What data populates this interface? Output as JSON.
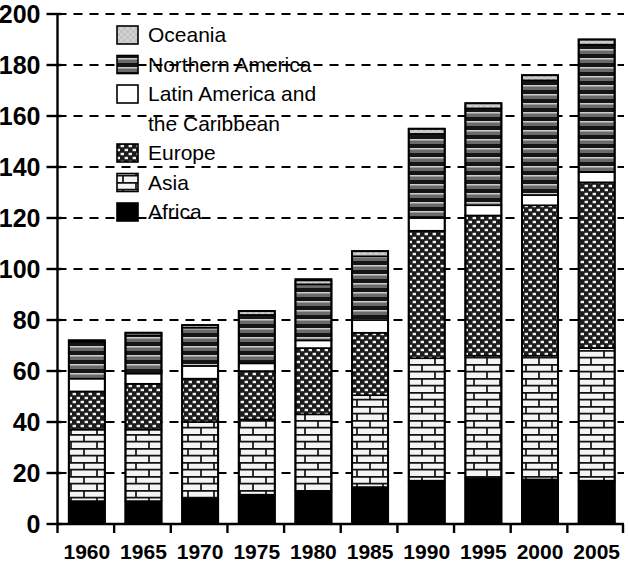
{
  "chart_data": {
    "type": "bar",
    "subtype": "stacked-bar",
    "title": "",
    "xlabel": "",
    "ylabel": "",
    "ylim": [
      0,
      200
    ],
    "ytick_step": 20,
    "yticks": [
      0,
      20,
      40,
      60,
      80,
      100,
      120,
      140,
      160,
      180,
      200
    ],
    "ytick_labels": [
      "0",
      "20",
      "40",
      "60",
      "80",
      "100",
      "120",
      "140",
      "160",
      "180",
      "200"
    ],
    "grid": "horizontal-dashed",
    "legend_position": "upper-left-inside",
    "categories": [
      "1960",
      "1965",
      "1970",
      "1975",
      "1980",
      "1985",
      "1990",
      "1995",
      "2000",
      "2005"
    ],
    "stack_order_bottom_to_top": [
      "Africa",
      "Asia",
      "Europe",
      "Latin America and the Caribbean",
      "Northern America",
      "Oceania"
    ],
    "series": [
      {
        "name": "Africa",
        "pattern": "solid-black",
        "color": "#000000",
        "values": [
          9,
          9,
          10,
          11.5,
          13,
          14.5,
          17,
          18,
          17.5,
          17
        ]
      },
      {
        "name": "Asia",
        "pattern": "brick-white",
        "color": "#f2f2f2",
        "values": [
          28,
          28,
          30,
          29.5,
          30,
          36,
          48,
          48,
          48.5,
          52
        ]
      },
      {
        "name": "Europe",
        "pattern": "dark-checker",
        "color": "#2b2b2b",
        "values": [
          15,
          18,
          17,
          19,
          26,
          24.5,
          50,
          55,
          59,
          65
        ]
      },
      {
        "name": "Latin America and the Caribbean",
        "pattern": "plain-white",
        "color": "#ffffff",
        "values": [
          5,
          4,
          5,
          3,
          3,
          5,
          5,
          4,
          4,
          4
        ]
      },
      {
        "name": "Northern America",
        "pattern": "horizontal-stripes",
        "color": "#555555",
        "values": [
          14.5,
          15,
          15,
          19,
          22,
          25,
          33,
          38,
          45,
          50
        ]
      },
      {
        "name": "Oceania",
        "pattern": "light-gray",
        "color": "#cccccc",
        "values": [
          0.5,
          1,
          1,
          1.5,
          1.5,
          2,
          2,
          2,
          2,
          2
        ]
      }
    ],
    "totals": [
      72,
      75,
      78,
      83.5,
      96,
      107,
      155,
      165,
      176,
      190
    ],
    "legend_entries": [
      {
        "label": "Oceania",
        "pattern": "light-gray"
      },
      {
        "label": "Northern America",
        "pattern": "horizontal-stripes"
      },
      {
        "label": "Latin America and",
        "pattern": "plain-white"
      },
      {
        "label": "the Caribbean",
        "pattern": "none"
      },
      {
        "label": "Europe",
        "pattern": "dark-checker"
      },
      {
        "label": "Asia",
        "pattern": "brick-white"
      },
      {
        "label": "Africa",
        "pattern": "solid-black"
      }
    ]
  }
}
